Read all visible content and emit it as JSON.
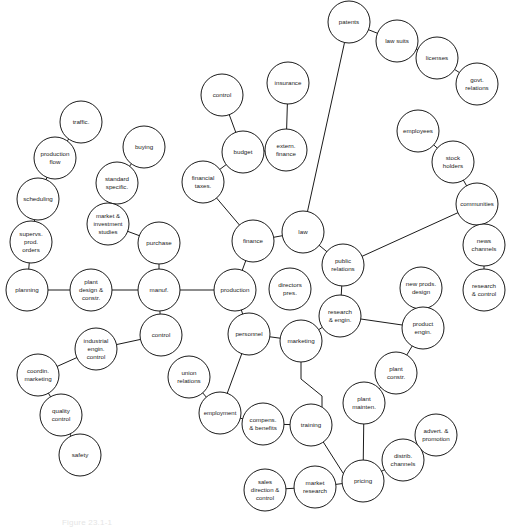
{
  "figure": {
    "caption": "Figure 23.1-1",
    "background_color": "#ffffff",
    "node_fill": "#ffffff",
    "stroke_color": "#1b1b1b",
    "width": 520,
    "height": 525
  },
  "chart_data": {
    "type": "diagram",
    "nodes": [
      {
        "id": "patents",
        "label": "patents",
        "lines": [
          "patents"
        ],
        "x": 349,
        "y": 22,
        "r": 21,
        "font": 6.2
      },
      {
        "id": "law_suits",
        "label": "law suits",
        "lines": [
          "law suits"
        ],
        "x": 397,
        "y": 41,
        "r": 21,
        "font": 6.2
      },
      {
        "id": "licenses",
        "label": "licenses",
        "lines": [
          "licenses"
        ],
        "x": 437,
        "y": 58,
        "r": 21,
        "font": 6.2
      },
      {
        "id": "govt_relations",
        "label": "govt. relations",
        "lines": [
          "govt.",
          "relations"
        ],
        "x": 477,
        "y": 84,
        "r": 21,
        "font": 6.2
      },
      {
        "id": "employees",
        "label": "employees",
        "lines": [
          "employees"
        ],
        "x": 418,
        "y": 131,
        "r": 21,
        "font": 6.2
      },
      {
        "id": "stock_holders",
        "label": "stock holders",
        "lines": [
          "stock",
          "holders"
        ],
        "x": 453,
        "y": 162,
        "r": 21,
        "font": 6.2
      },
      {
        "id": "communities",
        "label": "communities",
        "lines": [
          "communities"
        ],
        "x": 477,
        "y": 204,
        "r": 21,
        "font": 6.0
      },
      {
        "id": "news_channels",
        "label": "news channels",
        "lines": [
          "news",
          "channels"
        ],
        "x": 484,
        "y": 245,
        "r": 21,
        "font": 6.2
      },
      {
        "id": "research_ctrl",
        "label": "research & control",
        "lines": [
          "research",
          "& control"
        ],
        "x": 484,
        "y": 290,
        "r": 21,
        "font": 6.2
      },
      {
        "id": "control_top",
        "label": "control",
        "lines": [
          "control"
        ],
        "x": 222,
        "y": 95,
        "r": 21,
        "font": 6.2
      },
      {
        "id": "insurance",
        "label": "insurance",
        "lines": [
          "insurance"
        ],
        "x": 288,
        "y": 83,
        "r": 21,
        "font": 6.2
      },
      {
        "id": "budget",
        "label": "budget",
        "lines": [
          "budget"
        ],
        "x": 243,
        "y": 152,
        "r": 21,
        "font": 6.2
      },
      {
        "id": "extern_finance",
        "label": "extern. finance",
        "lines": [
          "extern.",
          "finance"
        ],
        "x": 286,
        "y": 150,
        "r": 21,
        "font": 6.2
      },
      {
        "id": "financial_taxes",
        "label": "financial taxes.",
        "lines": [
          "financial",
          "taxes."
        ],
        "x": 203,
        "y": 182,
        "r": 21,
        "font": 6.2
      },
      {
        "id": "traffic",
        "label": "traffic.",
        "lines": [
          "traffic."
        ],
        "x": 81,
        "y": 122,
        "r": 21,
        "font": 6.2
      },
      {
        "id": "production_flow",
        "label": "production flow",
        "lines": [
          "production",
          "flow"
        ],
        "x": 55,
        "y": 158,
        "r": 21,
        "font": 6.2
      },
      {
        "id": "scheduling",
        "label": "scheduling",
        "lines": [
          "scheduling"
        ],
        "x": 38,
        "y": 199,
        "r": 21,
        "font": 6.2
      },
      {
        "id": "supervs_prod",
        "label": "supervs. prod. orders",
        "lines": [
          "supervs.",
          "prod.",
          "orders"
        ],
        "x": 31,
        "y": 242,
        "r": 21,
        "font": 6.2
      },
      {
        "id": "buying",
        "label": "buying",
        "lines": [
          "buying"
        ],
        "x": 144,
        "y": 147,
        "r": 21,
        "font": 6.2
      },
      {
        "id": "standard_spec",
        "label": "standard specific.",
        "lines": [
          "standard",
          "specific."
        ],
        "x": 117,
        "y": 183,
        "r": 21,
        "font": 6.2
      },
      {
        "id": "market_invest",
        "label": "market & investment studies",
        "lines": [
          "market &",
          "investment",
          "studies"
        ],
        "x": 108,
        "y": 224,
        "r": 21,
        "font": 6.0
      },
      {
        "id": "purchase",
        "label": "purchase",
        "lines": [
          "purchase"
        ],
        "x": 159,
        "y": 243,
        "r": 21,
        "font": 6.2
      },
      {
        "id": "planning",
        "label": "planning",
        "lines": [
          "planning"
        ],
        "x": 27,
        "y": 290,
        "r": 21,
        "font": 6.2
      },
      {
        "id": "plant_design",
        "label": "plant design & constr.",
        "lines": [
          "plant",
          "design &",
          "constr."
        ],
        "x": 91,
        "y": 290,
        "r": 21,
        "font": 6.2
      },
      {
        "id": "manuf",
        "label": "manuf.",
        "lines": [
          "manuf."
        ],
        "x": 159,
        "y": 290,
        "r": 21,
        "font": 6.2
      },
      {
        "id": "production",
        "label": "production",
        "lines": [
          "production"
        ],
        "x": 235,
        "y": 290,
        "r": 21,
        "font": 6.2
      },
      {
        "id": "control_manuf",
        "label": "control",
        "lines": [
          "control"
        ],
        "x": 161,
        "y": 335,
        "r": 21,
        "font": 6.2
      },
      {
        "id": "ind_engin_ctrl",
        "label": "industrial engin. control",
        "lines": [
          "industrial",
          "engin.",
          "control"
        ],
        "x": 96,
        "y": 349,
        "r": 21,
        "font": 6.2
      },
      {
        "id": "coordin_mktg",
        "label": "coordin. marketing",
        "lines": [
          "coordin.",
          "marketing"
        ],
        "x": 38,
        "y": 375,
        "r": 21,
        "font": 6.2
      },
      {
        "id": "quality_ctrl",
        "label": "quality control",
        "lines": [
          "quality",
          "control"
        ],
        "x": 61,
        "y": 415,
        "r": 21,
        "font": 6.2
      },
      {
        "id": "safety",
        "label": "safety",
        "lines": [
          "safety"
        ],
        "x": 80,
        "y": 455,
        "r": 21,
        "font": 6.2
      },
      {
        "id": "finance",
        "label": "finance",
        "lines": [
          "finance"
        ],
        "x": 253,
        "y": 241,
        "r": 21,
        "font": 6.2
      },
      {
        "id": "law",
        "label": "law",
        "lines": [
          "law"
        ],
        "x": 303,
        "y": 232,
        "r": 21,
        "font": 6.2
      },
      {
        "id": "public_rel",
        "label": "public relations",
        "lines": [
          "public",
          "relations"
        ],
        "x": 343,
        "y": 265,
        "r": 21,
        "font": 6.2
      },
      {
        "id": "research_engin",
        "label": "research & engin.",
        "lines": [
          "research",
          "& engin."
        ],
        "x": 340,
        "y": 316,
        "r": 21,
        "font": 6.2
      },
      {
        "id": "marketing",
        "label": "marketing",
        "lines": [
          "marketing"
        ],
        "x": 301,
        "y": 341,
        "r": 21,
        "font": 6.2
      },
      {
        "id": "personnel",
        "label": "personnel",
        "lines": [
          "personnel"
        ],
        "x": 249,
        "y": 334,
        "r": 21,
        "font": 6.2
      },
      {
        "id": "directors_pres",
        "label": "directors pres.",
        "lines": [
          "directors",
          "pres."
        ],
        "x": 290,
        "y": 289,
        "r": 21,
        "font": 6.2
      },
      {
        "id": "union_rel",
        "label": "union relations",
        "lines": [
          "union",
          "relations"
        ],
        "x": 189,
        "y": 377,
        "r": 21,
        "font": 6.2
      },
      {
        "id": "employment",
        "label": "employment",
        "lines": [
          "employment"
        ],
        "x": 220,
        "y": 413,
        "r": 21,
        "font": 6.0
      },
      {
        "id": "compens",
        "label": "compens. & benefits",
        "lines": [
          "compens.",
          "& benefits"
        ],
        "x": 263,
        "y": 424,
        "r": 21,
        "font": 6.2
      },
      {
        "id": "training",
        "label": "training",
        "lines": [
          "training"
        ],
        "x": 311,
        "y": 425,
        "r": 21,
        "font": 6.2
      },
      {
        "id": "new_prods",
        "label": "new prods. design",
        "lines": [
          "new prods.",
          "design"
        ],
        "x": 421,
        "y": 288,
        "r": 21,
        "font": 6.2
      },
      {
        "id": "product_engin",
        "label": "product engin.",
        "lines": [
          "product",
          "engin."
        ],
        "x": 423,
        "y": 328,
        "r": 21,
        "font": 6.2
      },
      {
        "id": "plant_constr",
        "label": "plant constr.",
        "lines": [
          "plant",
          "constr."
        ],
        "x": 396,
        "y": 373,
        "r": 21,
        "font": 6.2
      },
      {
        "id": "plant_mainten",
        "label": "plant mainten.",
        "lines": [
          "plant",
          "mainten."
        ],
        "x": 364,
        "y": 403,
        "r": 21,
        "font": 6.2
      },
      {
        "id": "advert_promo",
        "label": "advert. & promotion",
        "lines": [
          "advert. &",
          "promotion"
        ],
        "x": 436,
        "y": 435,
        "r": 21,
        "font": 6.2
      },
      {
        "id": "distrib_chan",
        "label": "distrib. channels",
        "lines": [
          "distrib.",
          "channels"
        ],
        "x": 403,
        "y": 460,
        "r": 21,
        "font": 6.2
      },
      {
        "id": "pricing",
        "label": "pricing",
        "lines": [
          "pricing"
        ],
        "x": 363,
        "y": 481,
        "r": 21,
        "font": 6.2
      },
      {
        "id": "market_research",
        "label": "market research",
        "lines": [
          "market",
          "research"
        ],
        "x": 315,
        "y": 487,
        "r": 21,
        "font": 6.2
      },
      {
        "id": "sales_dir",
        "label": "sales direction & control",
        "lines": [
          "sales",
          "direction &",
          "control"
        ],
        "x": 265,
        "y": 490,
        "r": 21,
        "font": 6.0
      }
    ],
    "edges": [
      {
        "from": "patents",
        "to": "law_suits"
      },
      {
        "from": "law_suits",
        "to": "licenses"
      },
      {
        "from": "licenses",
        "to": "govt_relations"
      },
      {
        "from": "patents",
        "to": "law"
      },
      {
        "from": "employees",
        "to": "stock_holders"
      },
      {
        "from": "stock_holders",
        "to": "communities"
      },
      {
        "from": "communities",
        "to": "news_channels"
      },
      {
        "from": "news_channels",
        "to": "research_ctrl"
      },
      {
        "from": "communities",
        "to": "public_rel"
      },
      {
        "from": "control_top",
        "to": "budget"
      },
      {
        "from": "insurance",
        "to": "extern_finance"
      },
      {
        "from": "extern_finance",
        "to": "budget"
      },
      {
        "from": "budget",
        "to": "financial_taxes"
      },
      {
        "from": "financial_taxes",
        "to": "finance"
      },
      {
        "from": "traffic",
        "to": "production_flow"
      },
      {
        "from": "production_flow",
        "to": "scheduling"
      },
      {
        "from": "scheduling",
        "to": "supervs_prod"
      },
      {
        "from": "supervs_prod",
        "to": "planning"
      },
      {
        "from": "buying",
        "to": "standard_spec"
      },
      {
        "from": "standard_spec",
        "to": "market_invest"
      },
      {
        "from": "market_invest",
        "to": "purchase"
      },
      {
        "from": "purchase",
        "to": "manuf"
      },
      {
        "from": "planning",
        "to": "plant_design"
      },
      {
        "from": "plant_design",
        "to": "manuf"
      },
      {
        "from": "manuf",
        "to": "production"
      },
      {
        "from": "manuf",
        "to": "control_manuf"
      },
      {
        "from": "control_manuf",
        "to": "ind_engin_ctrl"
      },
      {
        "from": "ind_engin_ctrl",
        "to": "coordin_mktg"
      },
      {
        "from": "coordin_mktg",
        "to": "quality_ctrl"
      },
      {
        "from": "quality_ctrl",
        "to": "safety"
      },
      {
        "from": "finance",
        "to": "law"
      },
      {
        "from": "finance",
        "to": "production"
      },
      {
        "from": "law",
        "to": "public_rel"
      },
      {
        "from": "public_rel",
        "to": "research_engin"
      },
      {
        "from": "research_engin",
        "to": "marketing"
      },
      {
        "from": "marketing",
        "to": "personnel"
      },
      {
        "from": "personnel",
        "to": "production"
      },
      {
        "from": "personnel",
        "to": "employment"
      },
      {
        "from": "union_rel",
        "to": "employment"
      },
      {
        "from": "employment",
        "to": "compens"
      },
      {
        "from": "compens",
        "to": "training"
      },
      {
        "from": "research_engin",
        "to": "product_engin"
      },
      {
        "from": "new_prods",
        "to": "product_engin"
      },
      {
        "from": "product_engin",
        "to": "plant_constr"
      },
      {
        "from": "plant_constr",
        "to": "plant_mainten"
      },
      {
        "from": "plant_mainten",
        "to": "pricing"
      },
      {
        "from": "advert_promo",
        "to": "distrib_chan"
      },
      {
        "from": "distrib_chan",
        "to": "pricing"
      },
      {
        "from": "pricing",
        "to": "market_research"
      },
      {
        "from": "market_research",
        "to": "sales_dir"
      }
    ],
    "polyline_edges": [
      {
        "name": "marketing-to-pricing",
        "points": "301,362 301,379 322,396 322,440 343,473"
      }
    ]
  }
}
